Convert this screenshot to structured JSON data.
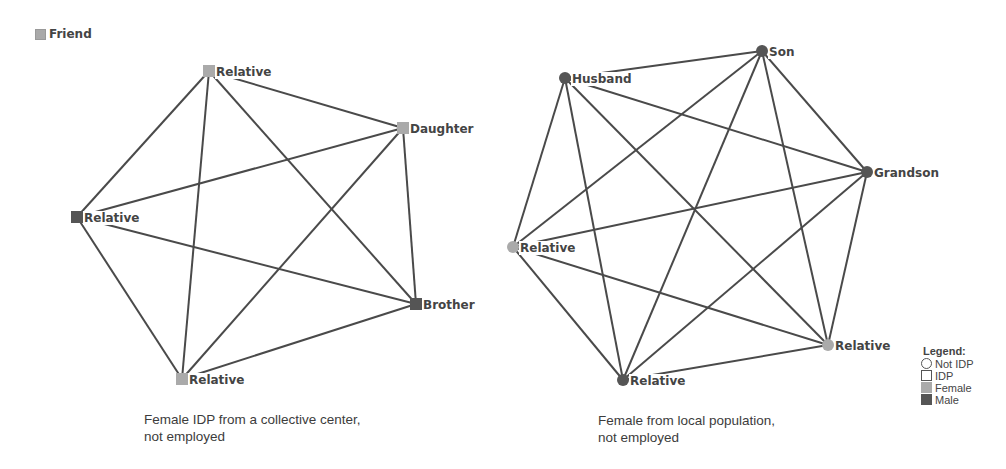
{
  "top_legend": {
    "label": "Friend",
    "color": "#a9a9a9",
    "shape": "square"
  },
  "colors": {
    "female": "#aaaaaa",
    "male": "#555555",
    "edge": "#4a4a4a"
  },
  "networks": [
    {
      "id": "left",
      "caption_line1": "Female IDP from a collective center,",
      "caption_line2": "not employed",
      "node_shape": "square",
      "nodes": [
        {
          "label": "Relative",
          "x": 209,
          "y": 71,
          "sex": "female"
        },
        {
          "label": "Daughter",
          "x": 403,
          "y": 128,
          "sex": "female"
        },
        {
          "label": "Relative",
          "x": 77,
          "y": 217,
          "sex": "male"
        },
        {
          "label": "Brother",
          "x": 416,
          "y": 304,
          "sex": "male"
        },
        {
          "label": "Relative",
          "x": 182,
          "y": 379,
          "sex": "female"
        }
      ],
      "edges": [
        [
          0,
          1
        ],
        [
          0,
          2
        ],
        [
          0,
          3
        ],
        [
          0,
          4
        ],
        [
          1,
          2
        ],
        [
          1,
          3
        ],
        [
          1,
          4
        ],
        [
          2,
          3
        ],
        [
          2,
          4
        ],
        [
          3,
          4
        ]
      ]
    },
    {
      "id": "right",
      "caption_line1": "Female from local population,",
      "caption_line2": "not employed",
      "node_shape": "circle",
      "nodes": [
        {
          "label": "Son",
          "x": 762,
          "y": 51,
          "sex": "male"
        },
        {
          "label": "Husband",
          "x": 565,
          "y": 78,
          "sex": "male"
        },
        {
          "label": "Grandson",
          "x": 867,
          "y": 172,
          "sex": "male"
        },
        {
          "label": "Relative",
          "x": 513,
          "y": 247,
          "sex": "female"
        },
        {
          "label": "Relative",
          "x": 828,
          "y": 345,
          "sex": "female"
        },
        {
          "label": "Relative",
          "x": 623,
          "y": 380,
          "sex": "male"
        }
      ],
      "edges": [
        [
          0,
          1
        ],
        [
          0,
          2
        ],
        [
          0,
          3
        ],
        [
          0,
          4
        ],
        [
          0,
          5
        ],
        [
          1,
          2
        ],
        [
          1,
          3
        ],
        [
          1,
          4
        ],
        [
          1,
          5
        ],
        [
          2,
          3
        ],
        [
          2,
          4
        ],
        [
          2,
          5
        ],
        [
          3,
          4
        ],
        [
          3,
          5
        ],
        [
          4,
          5
        ]
      ]
    }
  ],
  "legend": {
    "title": "Legend:",
    "items": [
      {
        "label": "Not IDP",
        "shape": "circle-outline"
      },
      {
        "label": "IDP",
        "shape": "square-outline"
      },
      {
        "label": "Female",
        "shape": "square-filled",
        "color": "#aaaaaa"
      },
      {
        "label": "Male",
        "shape": "square-filled",
        "color": "#555555"
      }
    ]
  }
}
